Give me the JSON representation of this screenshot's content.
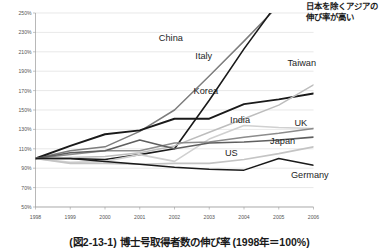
{
  "annotation": {
    "text": "日本を除くアジアの伸び率が高い"
  },
  "caption": {
    "text": "(図2-13-1) 博士号取得者数の伸び率 (1998年＝100%)"
  },
  "chart_data": {
    "type": "line",
    "title": "",
    "xlabel": "",
    "ylabel": "",
    "x": [
      1998,
      1999,
      2000,
      2001,
      2002,
      2003,
      2004,
      2005,
      2006
    ],
    "categories": [
      "1998",
      "1999",
      "2000",
      "2001",
      "2002",
      "2003",
      "2004",
      "2005",
      "2006"
    ],
    "ylim": [
      50,
      250
    ],
    "yticks": [
      50,
      70,
      90,
      110,
      130,
      150,
      170,
      190,
      210,
      230,
      250
    ],
    "ytick_labels": [
      "50%",
      "70%",
      "90%",
      "110%",
      "130%",
      "150%",
      "170%",
      "190%",
      "210%",
      "230%",
      "250%"
    ],
    "grid": true,
    "legend": "inline-labels",
    "series": [
      {
        "name": "China",
        "color": "#7d7d7d",
        "width": 1.5,
        "values": [
          100,
          108,
          112,
          128,
          150,
          185,
          221,
          258,
          300
        ],
        "label_x": 2001.55,
        "label_y": 221
      },
      {
        "name": "Italy",
        "color": "#1a1a1a",
        "width": 1.6,
        "values": [
          100,
          100,
          99,
          104,
          110,
          160,
          213,
          262,
          312
        ],
        "label_x": 2002.6,
        "label_y": 203
      },
      {
        "name": "Korea",
        "color": "#1a1a1a",
        "width": 1.9,
        "values": [
          100,
          113,
          125,
          129,
          141,
          141,
          156,
          161,
          167
        ],
        "label_x": 2002.55,
        "label_y": 166
      },
      {
        "name": "Taiwan",
        "color": "#bdbdbd",
        "width": 1.5,
        "values": [
          100,
          101,
          102,
          106,
          113,
          127,
          141,
          155,
          176
        ],
        "label_x": 2005.25,
        "label_y": 195
      },
      {
        "name": "India",
        "color": "#d0d0d0",
        "width": 1.6,
        "values": [
          100,
          96,
          97,
          104,
          97,
          120,
          134,
          132,
          131
        ],
        "label_x": 2003.6,
        "label_y": 137
      },
      {
        "name": "UK",
        "color": "#8c8c8c",
        "width": 1.5,
        "values": [
          100,
          104,
          108,
          108,
          116,
          117,
          122,
          126,
          131
        ],
        "label_x": 2005.45,
        "label_y": 133
      },
      {
        "name": "Japan",
        "color": "#5f5f5f",
        "width": 1.6,
        "values": [
          100,
          106,
          108,
          119,
          110,
          116,
          117,
          119,
          122
        ],
        "label_x": 2004.75,
        "label_y": 115
      },
      {
        "name": "US",
        "color": "#c4c4c4",
        "width": 1.6,
        "values": [
          100,
          95,
          95,
          94,
          95,
          95,
          99,
          105,
          112
        ],
        "label_x": 2003.45,
        "label_y": 103
      },
      {
        "name": "Germany",
        "color": "#1a1a1a",
        "width": 1.5,
        "values": [
          100,
          100,
          97,
          94,
          91,
          89,
          88,
          100,
          93
        ],
        "label_x": 2005.35,
        "label_y": 80
      }
    ]
  }
}
